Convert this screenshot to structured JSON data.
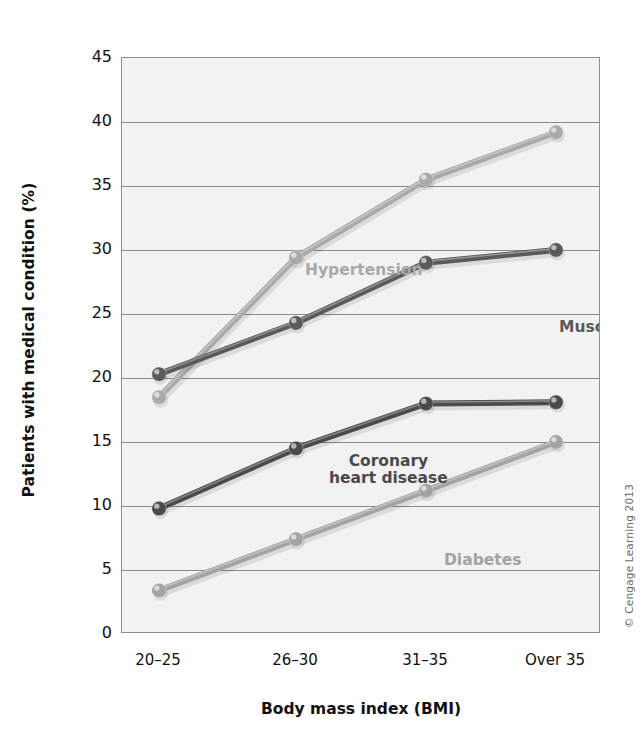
{
  "figure": {
    "copyright": "© Cengage Learning 2013"
  },
  "chart_data": {
    "type": "line",
    "title": "",
    "xlabel": "Body mass index (BMI)",
    "ylabel": "Patients with medical condition (%)",
    "categories": [
      "20–25",
      "26–30",
      "31–35",
      "Over 35"
    ],
    "ylim": [
      0,
      45
    ],
    "yticks": [
      0,
      5,
      10,
      15,
      20,
      25,
      30,
      35,
      40,
      45
    ],
    "ytick_labels": [
      "0",
      "5",
      "10",
      "15",
      "20",
      "25",
      "30",
      "35",
      "40",
      "45"
    ],
    "grid": "horizontal",
    "legend": "inline-labels",
    "series": [
      {
        "name": "Hypertension",
        "label": "Hypertension",
        "color": "#a9a9a9",
        "values": [
          18.5,
          29.4,
          35.5,
          39.2
        ]
      },
      {
        "name": "Musculoskeletal pain",
        "label": "Musculoskeletal\npain",
        "color": "#5a5a5a",
        "values": [
          20.3,
          24.3,
          29.0,
          30.0
        ]
      },
      {
        "name": "Coronary heart disease",
        "label": "Coronary\nheart disease",
        "color": "#4a4a4a",
        "values": [
          9.8,
          14.5,
          18.0,
          18.1
        ]
      },
      {
        "name": "Diabetes",
        "label": "Diabetes",
        "color": "#a3a3a3",
        "values": [
          3.4,
          7.4,
          11.2,
          15.0
        ]
      }
    ]
  }
}
